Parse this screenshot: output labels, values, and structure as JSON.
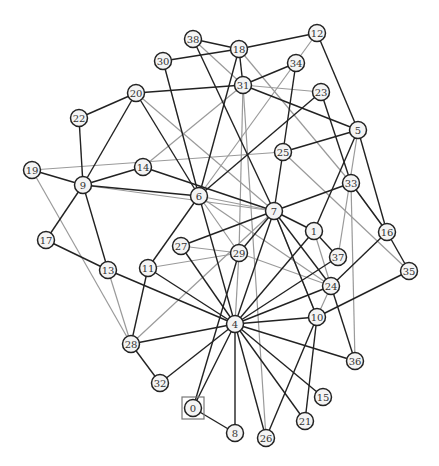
{
  "graph": {
    "title": "",
    "root_node": "0",
    "colors": {
      "dark_edge": "#222222",
      "light_edge": "#9a9a9a",
      "node_fill": "#f4f4f4",
      "node_stroke": "#222222"
    },
    "nodes": [
      {
        "id": "0",
        "x": 193,
        "y": 408
      },
      {
        "id": "1",
        "x": 314,
        "y": 231
      },
      {
        "id": "4",
        "x": 235,
        "y": 324
      },
      {
        "id": "5",
        "x": 358,
        "y": 130
      },
      {
        "id": "6",
        "x": 199,
        "y": 196
      },
      {
        "id": "7",
        "x": 274,
        "y": 211
      },
      {
        "id": "8",
        "x": 235,
        "y": 433
      },
      {
        "id": "9",
        "x": 83,
        "y": 185
      },
      {
        "id": "10",
        "x": 317,
        "y": 317
      },
      {
        "id": "11",
        "x": 148,
        "y": 268
      },
      {
        "id": "12",
        "x": 317,
        "y": 33
      },
      {
        "id": "13",
        "x": 108,
        "y": 270
      },
      {
        "id": "14",
        "x": 143,
        "y": 167
      },
      {
        "id": "15",
        "x": 323,
        "y": 397
      },
      {
        "id": "16",
        "x": 387,
        "y": 232
      },
      {
        "id": "17",
        "x": 46,
        "y": 240
      },
      {
        "id": "18",
        "x": 239,
        "y": 49
      },
      {
        "id": "19",
        "x": 32,
        "y": 170
      },
      {
        "id": "20",
        "x": 136,
        "y": 93
      },
      {
        "id": "21",
        "x": 305,
        "y": 421
      },
      {
        "id": "22",
        "x": 79,
        "y": 118
      },
      {
        "id": "23",
        "x": 321,
        "y": 92
      },
      {
        "id": "24",
        "x": 331,
        "y": 286
      },
      {
        "id": "25",
        "x": 283,
        "y": 152
      },
      {
        "id": "26",
        "x": 266,
        "y": 438
      },
      {
        "id": "27",
        "x": 181,
        "y": 246
      },
      {
        "id": "28",
        "x": 131,
        "y": 344
      },
      {
        "id": "29",
        "x": 239,
        "y": 253
      },
      {
        "id": "30",
        "x": 163,
        "y": 61
      },
      {
        "id": "31",
        "x": 243,
        "y": 85
      },
      {
        "id": "32",
        "x": 160,
        "y": 383
      },
      {
        "id": "33",
        "x": 351,
        "y": 183
      },
      {
        "id": "34",
        "x": 296,
        "y": 63
      },
      {
        "id": "35",
        "x": 409,
        "y": 271
      },
      {
        "id": "36",
        "x": 355,
        "y": 361
      },
      {
        "id": "37",
        "x": 338,
        "y": 257
      },
      {
        "id": "38",
        "x": 193,
        "y": 39
      }
    ],
    "edges_dark": [
      [
        "38",
        "18"
      ],
      [
        "38",
        "7"
      ],
      [
        "30",
        "18"
      ],
      [
        "30",
        "6"
      ],
      [
        "18",
        "12"
      ],
      [
        "18",
        "6"
      ],
      [
        "12",
        "5"
      ],
      [
        "34",
        "31"
      ],
      [
        "34",
        "25"
      ],
      [
        "20",
        "31"
      ],
      [
        "20",
        "22"
      ],
      [
        "20",
        "9"
      ],
      [
        "20",
        "6"
      ],
      [
        "31",
        "5"
      ],
      [
        "23",
        "6"
      ],
      [
        "23",
        "33"
      ],
      [
        "25",
        "5"
      ],
      [
        "25",
        "7"
      ],
      [
        "5",
        "1"
      ],
      [
        "5",
        "16"
      ],
      [
        "22",
        "9"
      ],
      [
        "19",
        "9"
      ],
      [
        "9",
        "14"
      ],
      [
        "9",
        "6"
      ],
      [
        "9",
        "17"
      ],
      [
        "9",
        "13"
      ],
      [
        "14",
        "7"
      ],
      [
        "6",
        "11"
      ],
      [
        "6",
        "4"
      ],
      [
        "7",
        "33"
      ],
      [
        "7",
        "27"
      ],
      [
        "7",
        "29"
      ],
      [
        "7",
        "4"
      ],
      [
        "7",
        "1"
      ],
      [
        "7",
        "24"
      ],
      [
        "7",
        "10"
      ],
      [
        "1",
        "4"
      ],
      [
        "1",
        "37"
      ],
      [
        "33",
        "16"
      ],
      [
        "16",
        "24"
      ],
      [
        "16",
        "35"
      ],
      [
        "27",
        "4"
      ],
      [
        "29",
        "0"
      ],
      [
        "17",
        "13"
      ],
      [
        "13",
        "4"
      ],
      [
        "11",
        "4"
      ],
      [
        "11",
        "28"
      ],
      [
        "28",
        "4"
      ],
      [
        "28",
        "32"
      ],
      [
        "32",
        "4"
      ],
      [
        "37",
        "4"
      ],
      [
        "24",
        "4"
      ],
      [
        "24",
        "36"
      ],
      [
        "10",
        "4"
      ],
      [
        "10",
        "35"
      ],
      [
        "10",
        "26"
      ],
      [
        "10",
        "21"
      ],
      [
        "4",
        "36"
      ],
      [
        "4",
        "15"
      ],
      [
        "4",
        "21"
      ],
      [
        "4",
        "26"
      ],
      [
        "4",
        "8"
      ],
      [
        "4",
        "0"
      ],
      [
        "0",
        "8"
      ],
      [
        "31",
        "18"
      ]
    ],
    "edges_light": [
      [
        "38",
        "31"
      ],
      [
        "18",
        "33"
      ],
      [
        "12",
        "6"
      ],
      [
        "31",
        "23"
      ],
      [
        "31",
        "29"
      ],
      [
        "31",
        "26"
      ],
      [
        "20",
        "7"
      ],
      [
        "19",
        "25"
      ],
      [
        "19",
        "28"
      ],
      [
        "14",
        "31"
      ],
      [
        "9",
        "7"
      ],
      [
        "6",
        "7"
      ],
      [
        "6",
        "29"
      ],
      [
        "6",
        "24"
      ],
      [
        "25",
        "35"
      ],
      [
        "5",
        "37"
      ],
      [
        "33",
        "36"
      ],
      [
        "33",
        "16"
      ],
      [
        "27",
        "29"
      ],
      [
        "11",
        "29"
      ],
      [
        "29",
        "24"
      ],
      [
        "29",
        "4"
      ],
      [
        "7",
        "10"
      ],
      [
        "13",
        "28"
      ],
      [
        "28",
        "7"
      ],
      [
        "1",
        "24"
      ],
      [
        "24",
        "10"
      ]
    ]
  }
}
